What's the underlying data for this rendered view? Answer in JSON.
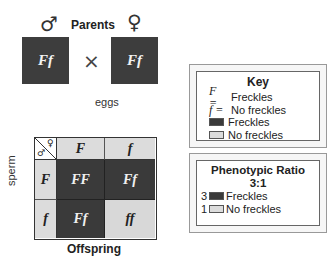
{
  "parents": {
    "title": "Parents",
    "male_symbol": "♂",
    "female_symbol": "♀",
    "male_genotype": "Ff",
    "female_genotype": "Ff",
    "cross_symbol": "×"
  },
  "punnett": {
    "top_label": "eggs",
    "side_label": "sperm",
    "bottom_label": "Offspring",
    "corner_male": "♂",
    "corner_female": "♀",
    "egg_alleles": [
      "F",
      "f"
    ],
    "sperm_alleles": [
      "F",
      "f"
    ],
    "cells": [
      {
        "genotype": "FF",
        "phenotype": "Freckles"
      },
      {
        "genotype": "Ff",
        "phenotype": "Freckles"
      },
      {
        "genotype": "Ff",
        "phenotype": "Freckles"
      },
      {
        "genotype": "ff",
        "phenotype": "No freckles"
      }
    ]
  },
  "key": {
    "title": "Key",
    "items": [
      {
        "symbol": "F =",
        "label": "Freckles"
      },
      {
        "symbol": "f =",
        "label": "No freckles"
      }
    ],
    "swatches": [
      {
        "color": "#3a3a3a",
        "label": "Freckles"
      },
      {
        "color": "#dcdcdc",
        "label": "No freckles"
      }
    ]
  },
  "ratio": {
    "title": "Phenotypic Ratio",
    "value": "3:1",
    "items": [
      {
        "count": "3",
        "color": "#3a3a3a",
        "label": "Freckles"
      },
      {
        "count": "1",
        "color": "#dcdcdc",
        "label": "No freckles"
      }
    ]
  },
  "colors": {
    "dominant": "#3a3a3a",
    "recessive": "#dcdcdc"
  }
}
